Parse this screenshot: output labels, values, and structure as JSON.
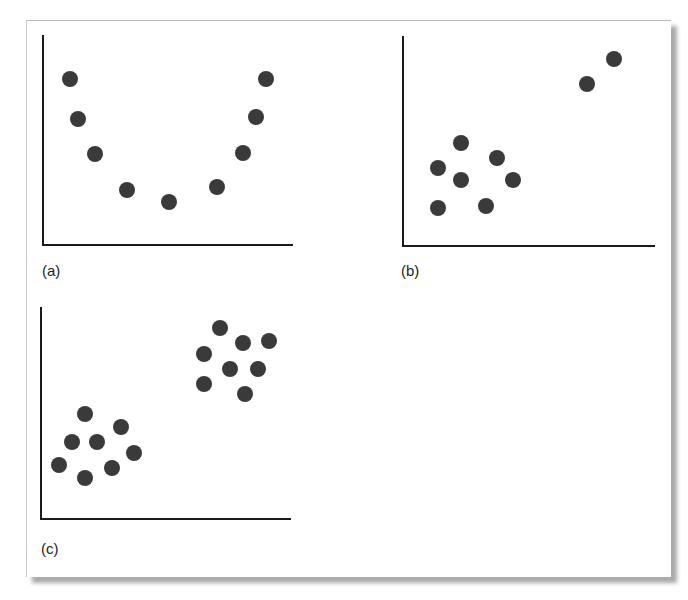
{
  "chart_data": [
    {
      "type": "scatter",
      "label": "(a)",
      "title": "",
      "xlabel": "",
      "ylabel": "",
      "points": [
        [
          70,
          79
        ],
        [
          78,
          119
        ],
        [
          95,
          154
        ],
        [
          127,
          190
        ],
        [
          169,
          202
        ],
        [
          217,
          187
        ],
        [
          243,
          153
        ],
        [
          256,
          117
        ],
        [
          266,
          79
        ]
      ],
      "axes": {
        "origin": [
          43,
          245
        ],
        "x_end": 293,
        "y_top": 35
      },
      "label_pos": [
        42,
        274
      ],
      "grid": false
    },
    {
      "type": "scatter",
      "label": "(b)",
      "title": "",
      "xlabel": "",
      "ylabel": "",
      "points": [
        [
          438,
          168
        ],
        [
          461,
          143
        ],
        [
          461,
          180
        ],
        [
          438,
          208
        ],
        [
          486,
          206
        ],
        [
          497,
          158
        ],
        [
          513,
          180
        ],
        [
          587,
          84
        ],
        [
          614,
          59
        ]
      ],
      "axes": {
        "origin": [
          403,
          246
        ],
        "x_end": 655,
        "y_top": 36
      },
      "label_pos": [
        401,
        274
      ],
      "grid": false
    },
    {
      "type": "scatter",
      "label": "(c)",
      "title": "",
      "xlabel": "",
      "ylabel": "",
      "points": [
        [
          85,
          414
        ],
        [
          72,
          442
        ],
        [
          97,
          442
        ],
        [
          121,
          427
        ],
        [
          59,
          465
        ],
        [
          85,
          478
        ],
        [
          112,
          468
        ],
        [
          134,
          453
        ],
        [
          220,
          328
        ],
        [
          243,
          343
        ],
        [
          269,
          341
        ],
        [
          204,
          354
        ],
        [
          230,
          369
        ],
        [
          258,
          369
        ],
        [
          204,
          384
        ],
        [
          245,
          394
        ]
      ],
      "axes": {
        "origin": [
          41,
          519
        ],
        "x_end": 291,
        "y_top": 307
      },
      "label_pos": [
        41,
        552
      ],
      "grid": false
    }
  ],
  "style": {
    "dot_color": "#3a3a3a",
    "axis_color": "#1a1a1a",
    "dot_radius": 8
  }
}
